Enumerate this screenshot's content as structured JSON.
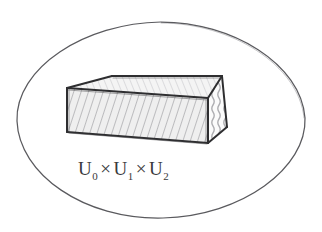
{
  "figure": {
    "kind": "hand-drawn-pencil-sketch",
    "title": "",
    "background_color": "#ffffff",
    "canvas": {
      "width": 322,
      "height": 232
    }
  },
  "boundary": {
    "name": "ellipse-region",
    "shape": "ellipse",
    "stroke_color": "#5a5a5e",
    "center": {
      "x": 161,
      "y": 120
    },
    "radius_x": 144,
    "radius_y": 98
  },
  "solid": {
    "name": "rectangular-box",
    "shape": "3d-box",
    "stroke_color": "#2e2e30",
    "faces": [
      {
        "id": "top-face",
        "shading": "light-diagonal-hatch",
        "fill": "#f2f2f2"
      },
      {
        "id": "front-face",
        "shading": "diagonal-hatch",
        "fill": "#ededed"
      },
      {
        "id": "right-face",
        "shading": "vertical-squiggle-hatch",
        "fill": "#fafafa"
      }
    ],
    "vertices": {
      "top_back_left": {
        "x": 112,
        "y": 76
      },
      "top_back_right": {
        "x": 222,
        "y": 76
      },
      "top_front_right": {
        "x": 208,
        "y": 98
      },
      "top_front_left": {
        "x": 67,
        "y": 88
      },
      "bottom_front_left": {
        "x": 67,
        "y": 132
      },
      "bottom_front_right": {
        "x": 208,
        "y": 143
      },
      "bottom_back_right": {
        "x": 227,
        "y": 127
      }
    }
  },
  "label": {
    "name": "product-space-label",
    "full_text": "U0 × U1 × U2",
    "terms": [
      {
        "base": "U",
        "subscript": "0"
      },
      {
        "base": "U",
        "subscript": "1"
      },
      {
        "base": "U",
        "subscript": "2"
      }
    ],
    "operator": "×",
    "position": {
      "x": 78,
      "y": 175
    },
    "color": "#3a3a3c"
  }
}
